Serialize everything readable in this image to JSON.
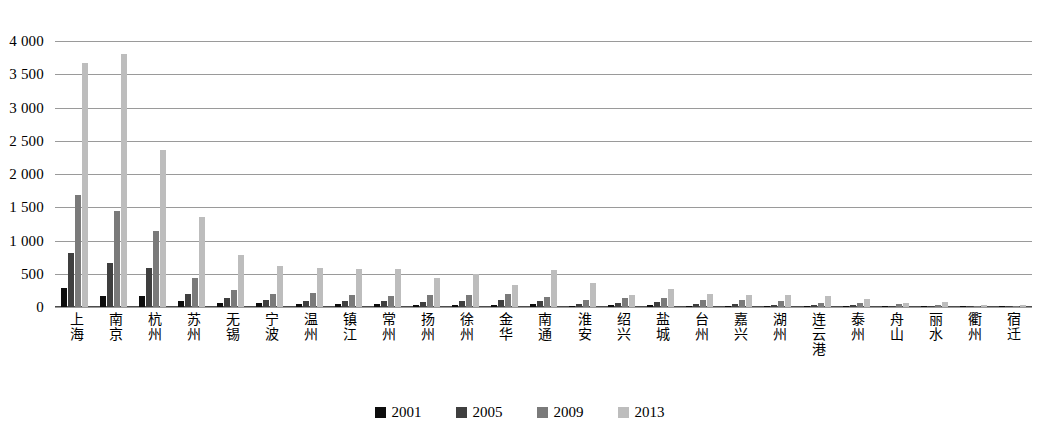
{
  "chart_data": {
    "type": "bar",
    "title": "",
    "subtitle": "",
    "xlabel": "",
    "ylabel": "",
    "ylim": [
      0,
      4000
    ],
    "ytick_step": 500,
    "ytick_labels": [
      "4 000",
      "3 500",
      "3 000",
      "2 500",
      "2 000",
      "1 500",
      "1 000",
      "500",
      "0"
    ],
    "ytick_values": [
      4000,
      3500,
      3000,
      2500,
      2000,
      1500,
      1000,
      500,
      0
    ],
    "grid": true,
    "legend_position": "bottom",
    "categories": [
      "上海",
      "南京",
      "杭州",
      "苏州",
      "无锡",
      "宁波",
      "温州",
      "镇江",
      "常州",
      "扬州",
      "徐州",
      "金华",
      "南通",
      "淮安",
      "绍兴",
      "盐城",
      "台州",
      "嘉兴",
      "湖州",
      "连云港",
      "泰州",
      "舟山",
      "丽水",
      "衢州",
      "宿迁"
    ],
    "series": [
      {
        "name": "2001",
        "color": "#0d0d0d",
        "values": [
          290,
          170,
          165,
          85,
          60,
          55,
          45,
          40,
          40,
          35,
          35,
          30,
          45,
          20,
          25,
          30,
          20,
          20,
          15,
          10,
          12,
          10,
          8,
          5,
          5
        ]
      },
      {
        "name": "2005",
        "color": "#3f3f3f",
        "values": [
          810,
          660,
          580,
          200,
          130,
          110,
          90,
          95,
          85,
          80,
          90,
          110,
          90,
          45,
          55,
          70,
          50,
          45,
          35,
          25,
          30,
          22,
          18,
          12,
          10
        ]
      },
      {
        "name": "2009",
        "color": "#7a7a7a",
        "values": [
          1680,
          1440,
          1140,
          440,
          250,
          200,
          215,
          175,
          165,
          175,
          185,
          200,
          150,
          110,
          130,
          140,
          110,
          100,
          90,
          60,
          55,
          45,
          35,
          22,
          18
        ]
      },
      {
        "name": "2013",
        "color": "#bdbdbd",
        "values": [
          3670,
          3810,
          2360,
          1350,
          780,
          610,
          590,
          575,
          575,
          430,
          500,
          330,
          560,
          355,
          175,
          275,
          200,
          180,
          175,
          160,
          115,
          65,
          70,
          30,
          25
        ]
      }
    ]
  },
  "legend": {
    "items": [
      {
        "label": "2001",
        "color": "#0d0d0d"
      },
      {
        "label": "2005",
        "color": "#3f3f3f"
      },
      {
        "label": "2009",
        "color": "#7a7a7a"
      },
      {
        "label": "2013",
        "color": "#bdbdbd"
      }
    ]
  },
  "colors": {
    "gridline": "#9a9a9a",
    "axis": "#4d4d4d",
    "background": "#ffffff"
  }
}
